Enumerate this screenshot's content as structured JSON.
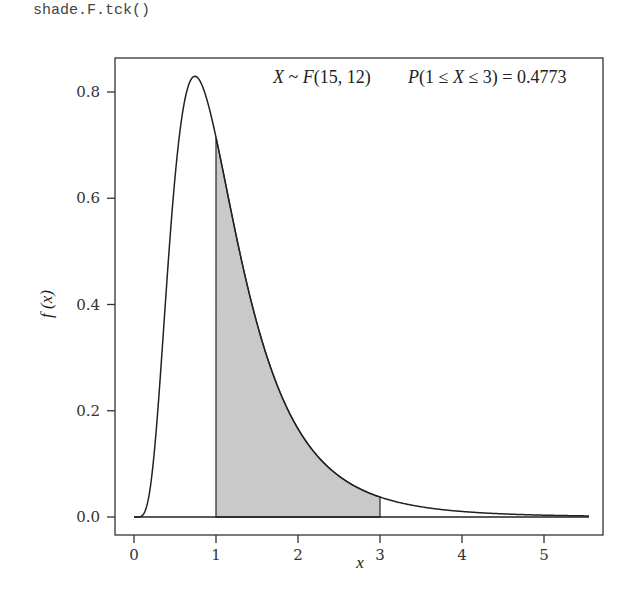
{
  "code_label": "shade.F.tck()",
  "chart_data": {
    "type": "area",
    "title": "",
    "distribution": "F",
    "df1": 15,
    "df2": 12,
    "annotation_left": "X ~ F(15, 12)",
    "annotation_right": "P(1 ≤ X ≤ 3) = 0.4773",
    "shade_from": 1,
    "shade_to": 3,
    "probability": 0.4773,
    "xlabel": "x",
    "ylabel": "f (x)",
    "xlim": [
      0,
      5.5
    ],
    "ylim": [
      0,
      0.83
    ],
    "x_ticks": [
      0,
      1,
      2,
      3,
      4,
      5
    ],
    "y_ticks": [
      "0.0",
      "0.2",
      "0.4",
      "0.6",
      "0.8"
    ],
    "grid": false,
    "sample_points": {
      "x": [
        0,
        0.25,
        0.5,
        0.743,
        1.0,
        1.5,
        2.0,
        2.5,
        3.0,
        4.0,
        5.0,
        5.5
      ],
      "y": [
        0,
        0.12,
        0.62,
        0.83,
        0.71,
        0.38,
        0.18,
        0.085,
        0.042,
        0.012,
        0.004,
        0.002
      ]
    },
    "colors": {
      "shade": "#c9c9c9",
      "line": "#222222"
    }
  }
}
